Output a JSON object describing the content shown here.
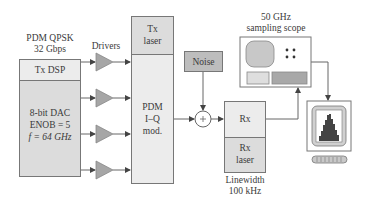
{
  "diagram": {
    "title_block": {
      "line1": "PDM QPSK",
      "line2": "32 Gbps"
    },
    "drivers_label": "Drivers",
    "tx_dsp": {
      "label": "Tx DSP",
      "dac_line1": "8-bit DAC",
      "dac_line2": "ENOB = 5",
      "dac_line3": "f = 64 GHz"
    },
    "tx_laser": {
      "line1": "Tx",
      "line2": "laser"
    },
    "modulator": {
      "line1": "PDM",
      "line2": "I–Q",
      "line3": "mod."
    },
    "noise": {
      "label": "Noise"
    },
    "adder": {
      "symbol": "+"
    },
    "rx": {
      "label": "Rx",
      "laser_line1": "Rx",
      "laser_line2": "laser",
      "linewidth_line1": "Linewidth",
      "linewidth_line2": "100 kHz"
    },
    "scope": {
      "line1": "50 GHz",
      "line2": "sampling scope"
    },
    "monitor": {
      "icon": "computer-monitor-histogram-icon"
    },
    "colors": {
      "box_light": "#ececec",
      "box_mid": "#dcdcdc",
      "box_dark": "#bdbdbd",
      "stroke": "#777777",
      "driver_fill": "#a6a6a6"
    }
  }
}
